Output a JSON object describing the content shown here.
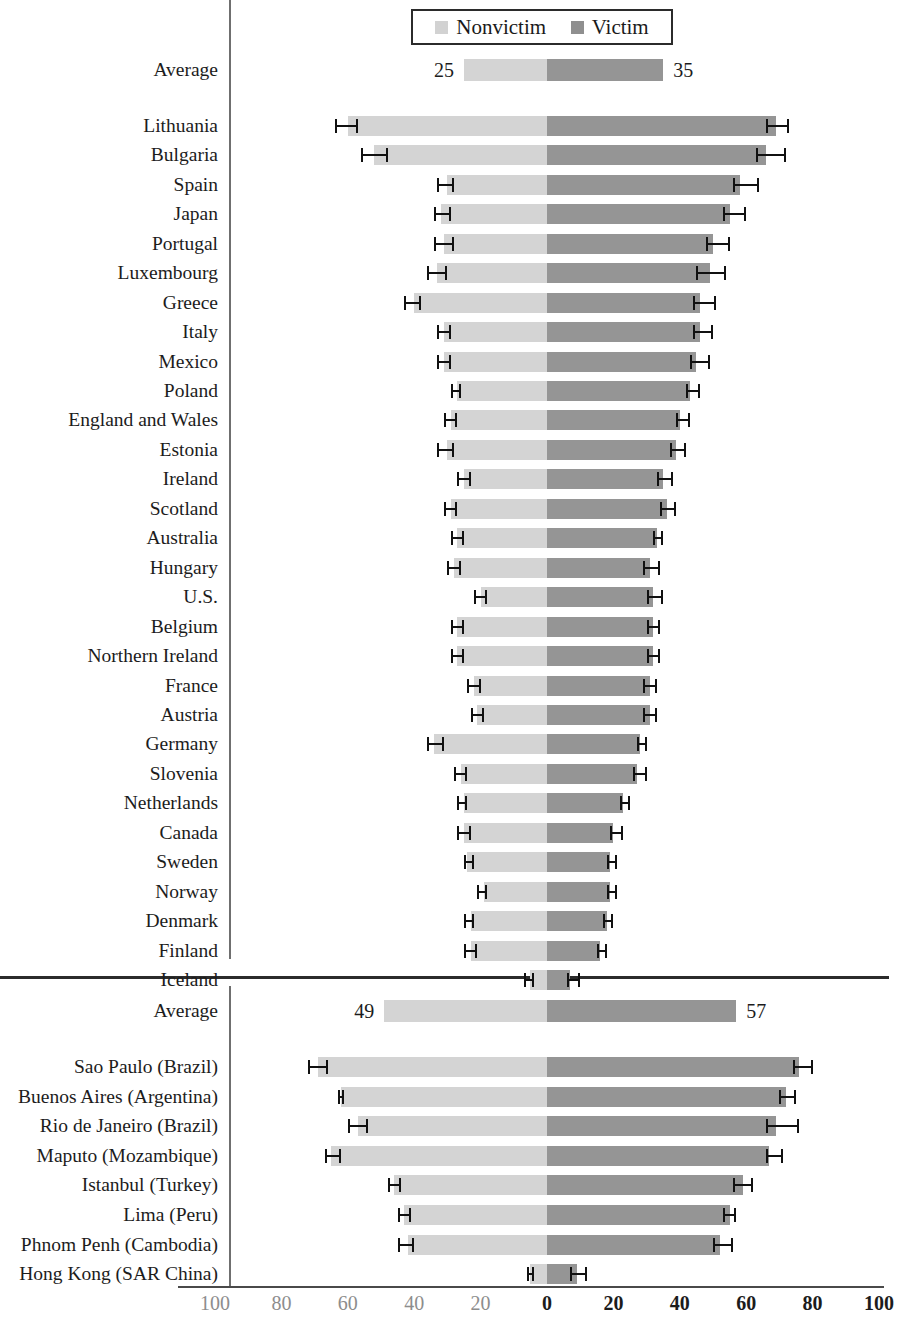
{
  "legend": {
    "items": [
      {
        "label": "Nonvictim",
        "color": "#d4d4d4",
        "key": "nonvictim"
      },
      {
        "label": "Victim",
        "color": "#959595",
        "key": "victim"
      }
    ]
  },
  "axis": {
    "ticks": [
      "100",
      "80",
      "60",
      "40",
      "20",
      "0",
      "20",
      "40",
      "60",
      "80",
      "100"
    ],
    "tick_values": [
      -100,
      -80,
      -60,
      -40,
      -20,
      0,
      20,
      40,
      60,
      80,
      100
    ],
    "zero_px": 547,
    "px_per_unit": 3.32,
    "min": -100,
    "max": 100
  },
  "chart_data": {
    "type": "bar",
    "subtype": "diverging-horizontal-paired-with-error-bars",
    "title": "",
    "xlabel": "",
    "ylabel": "",
    "xlim": [
      -100,
      100
    ],
    "grid": false,
    "legend_position": "top-center",
    "series": [
      {
        "name": "Nonvictim",
        "color": "#d4d4d4",
        "direction": "left"
      },
      {
        "name": "Victim",
        "color": "#959595",
        "direction": "right"
      }
    ],
    "note": "Left bars (Nonvictim) extend leftward from zero; right bars (Victim) extend rightward. Error bars show confidence intervals at each bar tip.",
    "panels": [
      {
        "name": "Countries",
        "average": {
          "label": "Average",
          "nonvictim": 25,
          "victim": 35,
          "show_values": true
        },
        "rows": [
          {
            "label": "Lithuania",
            "nonvictim": 60,
            "victim": 69,
            "nonvictim_ci": [
              64,
              57
            ],
            "victim_ci": [
              66,
              73
            ]
          },
          {
            "label": "Bulgaria",
            "nonvictim": 52,
            "victim": 66,
            "nonvictim_ci": [
              56,
              48
            ],
            "victim_ci": [
              63,
              72
            ]
          },
          {
            "label": "Spain",
            "nonvictim": 30,
            "victim": 58,
            "nonvictim_ci": [
              33,
              28
            ],
            "victim_ci": [
              56,
              64
            ]
          },
          {
            "label": "Japan",
            "nonvictim": 32,
            "victim": 55,
            "nonvictim_ci": [
              34,
              29
            ],
            "victim_ci": [
              53,
              60
            ]
          },
          {
            "label": "Portugal",
            "nonvictim": 31,
            "victim": 50,
            "nonvictim_ci": [
              34,
              28
            ],
            "victim_ci": [
              48,
              55
            ]
          },
          {
            "label": "Luxembourg",
            "nonvictim": 33,
            "victim": 49,
            "nonvictim_ci": [
              36,
              30
            ],
            "victim_ci": [
              45,
              54
            ]
          },
          {
            "label": "Greece",
            "nonvictim": 40,
            "victim": 46,
            "nonvictim_ci": [
              43,
              38
            ],
            "victim_ci": [
              44,
              51
            ]
          },
          {
            "label": "Italy",
            "nonvictim": 31,
            "victim": 46,
            "nonvictim_ci": [
              33,
              29
            ],
            "victim_ci": [
              44,
              50
            ]
          },
          {
            "label": "Mexico",
            "nonvictim": 31,
            "victim": 45,
            "nonvictim_ci": [
              33,
              29
            ],
            "victim_ci": [
              43,
              49
            ]
          },
          {
            "label": "Poland",
            "nonvictim": 27,
            "victim": 43,
            "nonvictim_ci": [
              29,
              26
            ],
            "victim_ci": [
              42,
              46
            ]
          },
          {
            "label": "England and Wales",
            "nonvictim": 29,
            "victim": 40,
            "nonvictim_ci": [
              31,
              27
            ],
            "victim_ci": [
              39,
              43
            ]
          },
          {
            "label": "Estonia",
            "nonvictim": 30,
            "victim": 39,
            "nonvictim_ci": [
              33,
              28
            ],
            "victim_ci": [
              37,
              42
            ]
          },
          {
            "label": "Ireland",
            "nonvictim": 25,
            "victim": 35,
            "nonvictim_ci": [
              27,
              23
            ],
            "victim_ci": [
              33,
              38
            ]
          },
          {
            "label": "Scotland",
            "nonvictim": 29,
            "victim": 36,
            "nonvictim_ci": [
              31,
              27
            ],
            "victim_ci": [
              34,
              39
            ]
          },
          {
            "label": "Australia",
            "nonvictim": 27,
            "victim": 33,
            "nonvictim_ci": [
              29,
              25
            ],
            "victim_ci": [
              32,
              35
            ]
          },
          {
            "label": "Hungary",
            "nonvictim": 28,
            "victim": 31,
            "nonvictim_ci": [
              30,
              26
            ],
            "victim_ci": [
              29,
              34
            ]
          },
          {
            "label": "U.S.",
            "nonvictim": 20,
            "victim": 32,
            "nonvictim_ci": [
              22,
              18
            ],
            "victim_ci": [
              30,
              35
            ]
          },
          {
            "label": "Belgium",
            "nonvictim": 27,
            "victim": 32,
            "nonvictim_ci": [
              29,
              25
            ],
            "victim_ci": [
              30,
              34
            ]
          },
          {
            "label": "Northern Ireland",
            "nonvictim": 27,
            "victim": 32,
            "nonvictim_ci": [
              29,
              25
            ],
            "victim_ci": [
              30,
              34
            ]
          },
          {
            "label": "France",
            "nonvictim": 22,
            "victim": 31,
            "nonvictim_ci": [
              24,
              20
            ],
            "victim_ci": [
              29,
              33
            ]
          },
          {
            "label": "Austria",
            "nonvictim": 21,
            "victim": 31,
            "nonvictim_ci": [
              23,
              19
            ],
            "victim_ci": [
              29,
              33
            ]
          },
          {
            "label": "Germany",
            "nonvictim": 34,
            "victim": 28,
            "nonvictim_ci": [
              36,
              31
            ],
            "victim_ci": [
              27,
              30
            ]
          },
          {
            "label": "Slovenia",
            "nonvictim": 26,
            "victim": 27,
            "nonvictim_ci": [
              28,
              24
            ],
            "victim_ci": [
              26,
              30
            ]
          },
          {
            "label": "Netherlands",
            "nonvictim": 25,
            "victim": 23,
            "nonvictim_ci": [
              27,
              24
            ],
            "victim_ci": [
              22,
              25
            ]
          },
          {
            "label": "Canada",
            "nonvictim": 25,
            "victim": 20,
            "nonvictim_ci": [
              27,
              23
            ],
            "victim_ci": [
              19,
              23
            ]
          },
          {
            "label": "Sweden",
            "nonvictim": 24,
            "victim": 19,
            "nonvictim_ci": [
              25,
              22
            ],
            "victim_ci": [
              18,
              21
            ]
          },
          {
            "label": "Norway",
            "nonvictim": 19,
            "victim": 19,
            "nonvictim_ci": [
              21,
              18
            ],
            "victim_ci": [
              18,
              21
            ]
          },
          {
            "label": "Denmark",
            "nonvictim": 23,
            "victim": 18,
            "nonvictim_ci": [
              25,
              22
            ],
            "victim_ci": [
              17,
              20
            ]
          },
          {
            "label": "Finland",
            "nonvictim": 23,
            "victim": 16,
            "nonvictim_ci": [
              25,
              21
            ],
            "victim_ci": [
              15,
              18
            ]
          },
          {
            "label": "Iceland",
            "nonvictim": 5,
            "victim": 7,
            "nonvictim_ci": [
              7,
              4
            ],
            "victim_ci": [
              6,
              10
            ]
          }
        ]
      },
      {
        "name": "Cities",
        "average": {
          "label": "Average",
          "nonvictim": 49,
          "victim": 57,
          "show_values": true
        },
        "rows": [
          {
            "label": "Sao Paulo (Brazil)",
            "nonvictim": 69,
            "victim": 76,
            "nonvictim_ci": [
              72,
              66
            ],
            "victim_ci": [
              74,
              80
            ]
          },
          {
            "label": "Buenos Aires (Argentina)",
            "nonvictim": 62,
            "victim": 72,
            "nonvictim_ci": [
              63,
              61
            ],
            "victim_ci": [
              70,
              75
            ]
          },
          {
            "label": "Rio de Janeiro (Brazil)",
            "nonvictim": 57,
            "victim": 69,
            "nonvictim_ci": [
              60,
              54
            ],
            "victim_ci": [
              66,
              76
            ]
          },
          {
            "label": "Maputo (Mozambique)",
            "nonvictim": 65,
            "victim": 67,
            "nonvictim_ci": [
              67,
              62
            ],
            "victim_ci": [
              66,
              71
            ]
          },
          {
            "label": "Istanbul (Turkey)",
            "nonvictim": 46,
            "victim": 59,
            "nonvictim_ci": [
              48,
              44
            ],
            "victim_ci": [
              56,
              62
            ]
          },
          {
            "label": "Lima (Peru)",
            "nonvictim": 43,
            "victim": 55,
            "nonvictim_ci": [
              45,
              41
            ],
            "victim_ci": [
              53,
              57
            ]
          },
          {
            "label": "Phnom Penh (Cambodia)",
            "nonvictim": 42,
            "victim": 52,
            "nonvictim_ci": [
              45,
              40
            ],
            "victim_ci": [
              50,
              56
            ]
          },
          {
            "label": "Hong Kong (SAR China)",
            "nonvictim": 5,
            "victim": 9,
            "nonvictim_ci": [
              6,
              4
            ],
            "victim_ci": [
              7,
              12
            ]
          }
        ]
      }
    ]
  }
}
